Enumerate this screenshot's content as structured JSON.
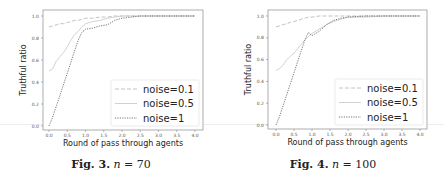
{
  "figures": [
    {
      "caption": {
        "label": "Fig. 3.",
        "var": "n",
        "eq": " = 70"
      }
    },
    {
      "caption": {
        "label": "Fig. 4.",
        "var": "n",
        "eq": " = 100"
      }
    }
  ],
  "chart_data": [
    {
      "type": "line",
      "title": "",
      "xlabel": "Round of pass through agents",
      "ylabel": "Truthful ratio",
      "xlim": [
        0.0,
        4.0
      ],
      "ylim": [
        0.0,
        1.0
      ],
      "xticks": [
        "0.0",
        "0.5",
        "1.0",
        "1.5",
        "2.0",
        "2.5",
        "3.0",
        "3.5",
        "4.0"
      ],
      "yticks": [
        "0.0",
        "0.2",
        "0.4",
        "0.6",
        "0.8",
        "1.0"
      ],
      "grid": false,
      "legend_position": "lower right",
      "series": [
        {
          "name": "noise=0.1",
          "style": "dashed",
          "color": "#bbbbbb",
          "x": [
            0.0,
            0.1,
            0.2,
            0.3,
            0.4,
            0.5,
            0.6,
            0.7,
            0.8,
            0.9,
            1.0,
            1.2,
            1.4,
            1.6,
            1.8,
            2.0,
            2.5,
            3.0,
            4.0
          ],
          "y": [
            0.9,
            0.91,
            0.92,
            0.93,
            0.93,
            0.94,
            0.95,
            0.96,
            0.96,
            0.97,
            0.98,
            0.98,
            0.99,
            0.99,
            1.0,
            1.0,
            1.0,
            1.0,
            1.0
          ]
        },
        {
          "name": "noise=0.5",
          "style": "solid",
          "color": "#cccccc",
          "x": [
            0.0,
            0.1,
            0.2,
            0.3,
            0.4,
            0.5,
            0.6,
            0.7,
            0.8,
            0.9,
            1.0,
            1.2,
            1.4,
            1.6,
            1.8,
            2.0,
            2.5,
            3.0,
            4.0
          ],
          "y": [
            0.5,
            0.52,
            0.59,
            0.63,
            0.67,
            0.72,
            0.78,
            0.83,
            0.86,
            0.9,
            0.93,
            0.95,
            0.96,
            0.98,
            0.99,
            1.0,
            1.0,
            1.0,
            1.0
          ]
        },
        {
          "name": "noise=1",
          "style": "dotted",
          "color": "#666666",
          "x": [
            0.0,
            0.1,
            0.2,
            0.3,
            0.4,
            0.5,
            0.6,
            0.7,
            0.8,
            0.9,
            1.0,
            1.2,
            1.4,
            1.6,
            1.8,
            2.0,
            2.5,
            3.0,
            4.0
          ],
          "y": [
            0.0,
            0.08,
            0.18,
            0.28,
            0.38,
            0.48,
            0.58,
            0.68,
            0.78,
            0.85,
            0.88,
            0.89,
            0.91,
            0.92,
            0.96,
            0.98,
            1.0,
            1.0,
            1.0
          ]
        }
      ]
    },
    {
      "type": "line",
      "title": "",
      "xlabel": "Round of pass through agents",
      "ylabel": "Truthful ratio",
      "xlim": [
        0.0,
        4.0
      ],
      "ylim": [
        0.0,
        1.0
      ],
      "xticks": [
        "0.0",
        "0.5",
        "1.0",
        "1.5",
        "2.0",
        "2.5",
        "3.0",
        "3.5",
        "4.0"
      ],
      "yticks": [
        "0.0",
        "0.2",
        "0.4",
        "0.6",
        "0.8",
        "1.0"
      ],
      "grid": false,
      "legend_position": "lower right",
      "series": [
        {
          "name": "noise=0.1",
          "style": "dashed",
          "color": "#bbbbbb",
          "x": [
            0.0,
            0.1,
            0.2,
            0.3,
            0.4,
            0.5,
            0.6,
            0.7,
            0.8,
            0.9,
            1.0,
            1.2,
            1.4,
            1.6,
            1.8,
            2.0,
            2.5,
            3.0,
            4.0
          ],
          "y": [
            0.9,
            0.91,
            0.92,
            0.93,
            0.94,
            0.95,
            0.96,
            0.97,
            0.98,
            0.99,
            0.99,
            1.0,
            1.0,
            1.0,
            1.0,
            1.0,
            1.0,
            1.0,
            1.0
          ]
        },
        {
          "name": "noise=0.5",
          "style": "solid",
          "color": "#cccccc",
          "x": [
            0.0,
            0.1,
            0.2,
            0.3,
            0.4,
            0.5,
            0.6,
            0.7,
            0.8,
            0.9,
            1.0,
            1.2,
            1.4,
            1.6,
            1.8,
            2.0,
            2.5,
            3.0,
            4.0
          ],
          "y": [
            0.5,
            0.52,
            0.55,
            0.6,
            0.63,
            0.66,
            0.7,
            0.74,
            0.78,
            0.81,
            0.84,
            0.88,
            0.92,
            0.95,
            0.97,
            0.99,
            0.99,
            1.0,
            1.0
          ]
        },
        {
          "name": "noise=1",
          "style": "dotted",
          "color": "#666666",
          "x": [
            0.0,
            0.1,
            0.2,
            0.3,
            0.4,
            0.5,
            0.6,
            0.7,
            0.8,
            0.9,
            1.0,
            1.2,
            1.4,
            1.6,
            1.8,
            2.0,
            2.5,
            3.0,
            4.0
          ],
          "y": [
            0.0,
            0.08,
            0.18,
            0.28,
            0.38,
            0.48,
            0.58,
            0.68,
            0.78,
            0.85,
            0.82,
            0.86,
            0.92,
            0.96,
            0.98,
            0.99,
            1.0,
            1.0,
            1.0
          ]
        }
      ]
    }
  ]
}
